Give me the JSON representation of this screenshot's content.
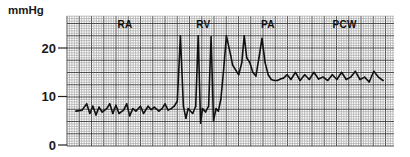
{
  "chart_data": {
    "type": "line",
    "title": "",
    "ylabel": "mmHg",
    "xlabel": "",
    "ylim": [
      0,
      26.5
    ],
    "xlim": [
      0,
      100
    ],
    "grid": true,
    "yticks": [
      {
        "value": 0,
        "label": "0"
      },
      {
        "value": 10,
        "label": "10"
      },
      {
        "value": 20,
        "label": "20"
      }
    ],
    "annotations": [
      {
        "label": "RA",
        "x": 16
      },
      {
        "label": "RV",
        "x": 41.5
      },
      {
        "label": "PA",
        "x": 62.5
      },
      {
        "label": "PCW",
        "x": 87.5
      }
    ],
    "series": [
      {
        "name": "Pulmonary artery catheter pressure tracing",
        "color": "#111111",
        "x": [
          0,
          2,
          3.5,
          4.5,
          5.5,
          6.5,
          7.5,
          8.5,
          10,
          11,
          12,
          13,
          14,
          15.5,
          16.5,
          17.5,
          18.5,
          19.5,
          21,
          22,
          23.5,
          24.5,
          25.5,
          27,
          28,
          29,
          30,
          31,
          32,
          33,
          34,
          35,
          35.8,
          36.5,
          38,
          39,
          39.8,
          40.6,
          41.2,
          42.2,
          43.2,
          44,
          44.8,
          45.6,
          46.4,
          47.2,
          48,
          49,
          50.4,
          51,
          52,
          53,
          54,
          54.8,
          55.6,
          56.6,
          57.6,
          58.6,
          59.6,
          60.6,
          61.6,
          62.6,
          63.6,
          64.6,
          65.6,
          66.6,
          67.6,
          68.8,
          70,
          71.5,
          73,
          74.5,
          76,
          77.5,
          79,
          80.5,
          82,
          83.5,
          85,
          86.5,
          88,
          89.5,
          91,
          92.5,
          94,
          95.5,
          97,
          98.5,
          100
        ],
        "y": [
          7,
          7.2,
          8.5,
          6.5,
          8,
          6.2,
          7.8,
          6.8,
          7.5,
          8.5,
          6.5,
          8.2,
          6.5,
          7.2,
          8.5,
          6,
          7.5,
          7,
          8,
          6.5,
          8,
          7.3,
          7.8,
          7,
          7.5,
          8.5,
          7.2,
          7.5,
          8,
          9,
          22.5,
          8,
          5.5,
          7.5,
          6.5,
          8,
          22.5,
          4.5,
          7.5,
          6.8,
          8,
          22.3,
          5,
          7.5,
          7,
          9.5,
          15,
          22.5,
          18.5,
          16.5,
          15.5,
          14.5,
          17,
          22.5,
          18,
          17,
          15,
          14.2,
          18,
          22,
          17,
          14.5,
          13.5,
          13.3,
          13.3,
          13.6,
          13.8,
          14.5,
          13.5,
          15,
          13.3,
          14.5,
          13.5,
          15,
          13.6,
          14,
          13.3,
          14.5,
          13.5,
          15,
          13.5,
          14,
          15.2,
          13.5,
          14,
          13,
          15.2,
          14,
          13.3
        ]
      }
    ]
  },
  "axis": {
    "unit_label": "mmHg"
  },
  "colors": {
    "trace": "#111111",
    "grid_minor": "#9a9a9a",
    "grid_major": "#3c3c3c",
    "paper": "#ffffff"
  }
}
